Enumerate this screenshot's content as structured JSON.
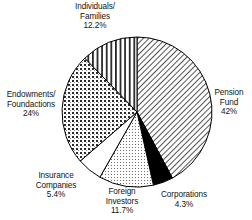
{
  "chart_data": {
    "type": "pie",
    "title": "",
    "subtitle": "",
    "xlabel": "",
    "ylabel": "",
    "legend_position": "none",
    "grid": false,
    "start_angle_deg": 0,
    "direction": "clockwise",
    "center": {
      "x": 137,
      "y": 112
    },
    "radius": 75,
    "categories": [
      "Pension Fund",
      "Corporations",
      "Foreign Investors",
      "Insurance Companies",
      "Endowments/ Foundactions",
      "Individuals/ Families"
    ],
    "values": [
      42,
      4.3,
      11.7,
      5.4,
      24,
      12.2
    ],
    "slices": [
      {
        "name": "pension-fund",
        "label_line1": "Pension",
        "label_line2": "Fund",
        "value_text": "42%",
        "value": 42,
        "pattern": "diagonal-hatch",
        "fill_color": "#ffffff",
        "stroke_color": "#000000"
      },
      {
        "name": "corporations",
        "label_line1": "Corporations",
        "label_line2": "",
        "value_text": "4.3%",
        "value": 4.3,
        "pattern": "solid-black",
        "fill_color": "#000000",
        "stroke_color": "#000000"
      },
      {
        "name": "foreign-investors",
        "label_line1": "Foreign",
        "label_line2": "Investors",
        "value_text": "11.7%",
        "value": 11.7,
        "pattern": "fine-dots",
        "fill_color": "#ffffff",
        "stroke_color": "#000000"
      },
      {
        "name": "insurance-companies",
        "label_line1": "Insurance",
        "label_line2": "Companies",
        "value_text": "5.4%",
        "value": 5.4,
        "pattern": "blank-white",
        "fill_color": "#ffffff",
        "stroke_color": "#000000"
      },
      {
        "name": "endowments-foundations",
        "label_line1": "Endowments/",
        "label_line2": "Foundactions",
        "value_text": "24%",
        "value": 24,
        "pattern": "dense-checker-dots",
        "fill_color": "#ffffff",
        "stroke_color": "#000000"
      },
      {
        "name": "individuals-families",
        "label_line1": "Individuals/",
        "label_line2": "Families",
        "value_text": "12.2%",
        "value": 12.2,
        "pattern": "vertical-stripes",
        "fill_color": "#ffffff",
        "stroke_color": "#000000"
      }
    ]
  },
  "labels": {
    "individuals": "Individuals/\nFamilies\n12.2%",
    "pension": "Pension\nFund\n42%",
    "endowments": "Endowments/\nFoundactions\n24%",
    "insurance": "Insurance\nCompanies\n5.4%",
    "foreign": "Foreign\nInvestors\n11.7%",
    "corporations": "Corporations\n4.3%"
  }
}
